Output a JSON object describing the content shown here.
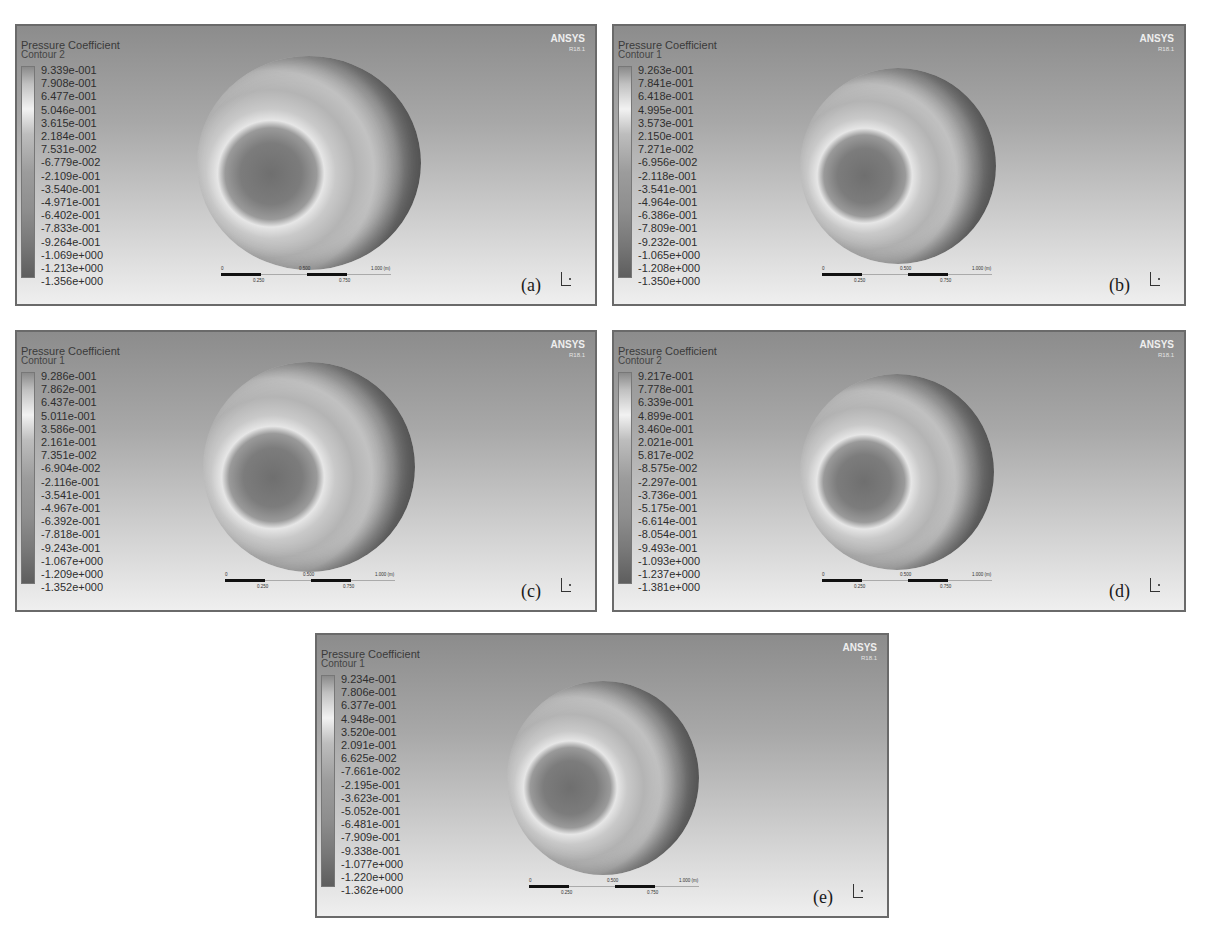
{
  "figure": {
    "panels": [
      {
        "id": "a",
        "label": "(a)",
        "title": "Pressure Coefficient",
        "contour": "Contour 2",
        "brand": "ANSYS",
        "version": "R18.1",
        "legend_values": [
          "9.339e-001",
          "7.908e-001",
          "6.477e-001",
          "5.046e-001",
          "3.615e-001",
          "2.184e-001",
          "7.531e-002",
          "-6.779e-002",
          "-2.109e-001",
          "-3.540e-001",
          "-4.971e-001",
          "-6.402e-001",
          "-7.833e-001",
          "-9.264e-001",
          "-1.069e+000",
          "-1.213e+000",
          "-1.356e+000"
        ],
        "scale": {
          "t0": "0",
          "t025": "0.250",
          "t05": "0.500",
          "t075": "0.750",
          "t1": "1.000 (m)"
        }
      },
      {
        "id": "b",
        "label": "(b)",
        "title": "Pressure Coefficient",
        "contour": "Contour 1",
        "brand": "ANSYS",
        "version": "R18.1",
        "legend_values": [
          "9.263e-001",
          "7.841e-001",
          "6.418e-001",
          "4.995e-001",
          "3.573e-001",
          "2.150e-001",
          "7.271e-002",
          "-6.956e-002",
          "-2.118e-001",
          "-3.541e-001",
          "-4.964e-001",
          "-6.386e-001",
          "-7.809e-001",
          "-9.232e-001",
          "-1.065e+000",
          "-1.208e+000",
          "-1.350e+000"
        ],
        "scale": {
          "t0": "0",
          "t025": "0.250",
          "t05": "0.500",
          "t075": "0.750",
          "t1": "1.000 (m)"
        }
      },
      {
        "id": "c",
        "label": "(c)",
        "title": "Pressure Coefficient",
        "contour": "Contour 1",
        "brand": "ANSYS",
        "version": "R18.1",
        "legend_values": [
          "9.286e-001",
          "7.862e-001",
          "6.437e-001",
          "5.011e-001",
          "3.586e-001",
          "2.161e-001",
          "7.351e-002",
          "-6.904e-002",
          "-2.116e-001",
          "-3.541e-001",
          "-4.967e-001",
          "-6.392e-001",
          "-7.818e-001",
          "-9.243e-001",
          "-1.067e+000",
          "-1.209e+000",
          "-1.352e+000"
        ],
        "scale": {
          "t0": "0",
          "t025": "0.250",
          "t05": "0.500",
          "t075": "0.750",
          "t1": "1.000 (m)"
        }
      },
      {
        "id": "d",
        "label": "(d)",
        "title": "Pressure Coefficient",
        "contour": "Contour 2",
        "brand": "ANSYS",
        "version": "R18.1",
        "legend_values": [
          "9.217e-001",
          "7.778e-001",
          "6.339e-001",
          "4.899e-001",
          "3.460e-001",
          "2.021e-001",
          "5.817e-002",
          "-8.575e-002",
          "-2.297e-001",
          "-3.736e-001",
          "-5.175e-001",
          "-6.614e-001",
          "-8.054e-001",
          "-9.493e-001",
          "-1.093e+000",
          "-1.237e+000",
          "-1.381e+000"
        ],
        "scale": {
          "t0": "0",
          "t025": "0.250",
          "t05": "0.500",
          "t075": "0.750",
          "t1": "1.000 (m)"
        }
      },
      {
        "id": "e",
        "label": "(e)",
        "title": "Pressure Coefficient",
        "contour": "Contour 1",
        "brand": "ANSYS",
        "version": "R18.1",
        "legend_values": [
          "9.234e-001",
          "7.806e-001",
          "6.377e-001",
          "4.948e-001",
          "3.520e-001",
          "2.091e-001",
          "6.625e-002",
          "-7.661e-002",
          "-2.195e-001",
          "-3.623e-001",
          "-5.052e-001",
          "-6.481e-001",
          "-7.909e-001",
          "-9.338e-001",
          "-1.077e+000",
          "-1.220e+000",
          "-1.362e+000"
        ],
        "scale": {
          "t0": "0",
          "t025": "0.250",
          "t05": "0.500",
          "t075": "0.750",
          "t1": "1.000 (m)"
        }
      }
    ]
  }
}
